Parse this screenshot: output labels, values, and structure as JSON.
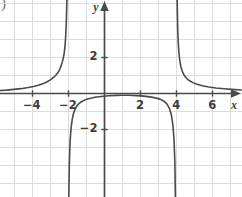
{
  "figure": {
    "corner_mark": ")",
    "background": "#ffffff",
    "grid_color": "#dcdcdc",
    "axis_color": "#4a4a4a",
    "curve_color": "#4a4a4a",
    "label_color": "#3d3d3d"
  },
  "axes": {
    "x_name": "x",
    "y_name": "y",
    "x_tick_labels": [
      "−4",
      "−2",
      "2",
      "4",
      "6"
    ],
    "x_tick_values": [
      -4,
      -2,
      2,
      4,
      6
    ],
    "y_tick_labels": [
      "2",
      "−2"
    ],
    "y_tick_values": [
      2,
      -2
    ]
  },
  "chart_data": {
    "type": "line",
    "title": "",
    "xlabel": "x",
    "ylabel": "y",
    "xlim": [
      -5.75,
      7.6
    ],
    "ylim": [
      -5.15,
      5.15
    ],
    "grid": true,
    "grid_step": 1,
    "legend": null,
    "annotations": [],
    "asymptotes": {
      "vertical": [
        -2,
        4
      ],
      "horizontal": [
        0
      ]
    },
    "series": [
      {
        "name": "left-branch",
        "comment": "x < -2, approaches y=0 from above as x -> -inf, rises to +inf at x = -2",
        "x": [
          -5.75,
          -5.4,
          -5.0,
          -4.6,
          -4.2,
          -3.9,
          -3.6,
          -3.35,
          -3.15,
          -2.95,
          -2.8,
          -2.68,
          -2.56,
          -2.46,
          -2.38,
          -2.31,
          -2.25,
          -2.2,
          -2.16,
          -2.13,
          -2.105,
          -2.085,
          -2.07,
          -2.058,
          -2.048,
          -2.04,
          -2.034,
          -2.029,
          -2.025
        ],
        "y": [
          0.14,
          0.16,
          0.2,
          0.24,
          0.3,
          0.36,
          0.44,
          0.53,
          0.62,
          0.74,
          0.86,
          0.97,
          1.12,
          1.3,
          1.5,
          1.72,
          1.96,
          2.25,
          2.6,
          3.0,
          3.5,
          4.05,
          4.6,
          5.1,
          5.8,
          6.6,
          7.5,
          8.6,
          10.0
        ]
      },
      {
        "name": "middle-branch",
        "comment": "-2 < x < 4, downward arch, -inf at both ends, max about y = -0.11 near x = 1",
        "x": [
          -1.975,
          -1.97,
          -1.962,
          -1.952,
          -1.94,
          -1.925,
          -1.905,
          -1.88,
          -1.85,
          -1.81,
          -1.76,
          -1.7,
          -1.62,
          -1.52,
          -1.4,
          -1.25,
          -1.05,
          -0.8,
          -0.5,
          -0.15,
          0.25,
          0.7,
          1.0,
          1.35,
          1.8,
          2.2,
          2.55,
          2.85,
          3.1,
          3.3,
          3.48,
          3.62,
          3.73,
          3.82,
          3.88,
          3.925,
          3.952,
          3.97,
          3.978
        ],
        "y": [
          -10.0,
          -8.6,
          -7.2,
          -6.1,
          -5.1,
          -4.2,
          -3.4,
          -2.75,
          -2.25,
          -1.82,
          -1.46,
          -1.17,
          -0.93,
          -0.74,
          -0.6,
          -0.48,
          -0.38,
          -0.3,
          -0.24,
          -0.19,
          -0.155,
          -0.13,
          -0.125,
          -0.128,
          -0.145,
          -0.175,
          -0.215,
          -0.27,
          -0.34,
          -0.44,
          -0.6,
          -0.84,
          -1.2,
          -1.8,
          -2.6,
          -3.8,
          -5.6,
          -8.2,
          -10.0
        ]
      },
      {
        "name": "right-branch",
        "comment": "x > 4, +inf at x = 4, decays to y=0 from above as x -> +inf",
        "x": [
          4.022,
          4.03,
          4.04,
          4.05,
          4.065,
          4.085,
          4.11,
          4.145,
          4.19,
          4.25,
          4.33,
          4.43,
          4.56,
          4.72,
          4.92,
          5.16,
          5.45,
          5.8,
          6.2,
          6.65,
          7.1,
          7.6
        ],
        "y": [
          10.0,
          8.4,
          6.6,
          5.5,
          4.4,
          3.5,
          2.85,
          2.3,
          1.86,
          1.5,
          1.22,
          1.0,
          0.83,
          0.69,
          0.575,
          0.48,
          0.4,
          0.335,
          0.28,
          0.235,
          0.2,
          0.17
        ]
      }
    ]
  },
  "geometry": {
    "origin_x": 104,
    "origin_y": 93,
    "unit_px": 18.05,
    "width": 242,
    "height": 197
  }
}
